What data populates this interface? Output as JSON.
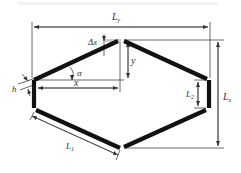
{
  "diagram": {
    "type": "hexagonal honeycomb cell geometry",
    "caption_faint": "",
    "colors": {
      "member": "#111111",
      "dimension_line": "#444444",
      "label": "#333333",
      "background": "#ffffff"
    },
    "labels": {
      "Ly": {
        "main": "L",
        "sub": "y"
      },
      "Lx": {
        "main": "L",
        "sub": "x"
      },
      "L1": {
        "main": "L",
        "sub": "1"
      },
      "L2": {
        "main": "L",
        "sub": "2"
      },
      "x": "x",
      "y": "y",
      "alpha": "α",
      "delta_x": "Δx",
      "h": "h"
    },
    "elements": [
      "inclined-wall-top-left",
      "inclined-wall-top-right",
      "inclined-wall-bottom-left",
      "inclined-wall-bottom-right",
      "vertical-wall-left",
      "vertical-wall-right"
    ]
  }
}
